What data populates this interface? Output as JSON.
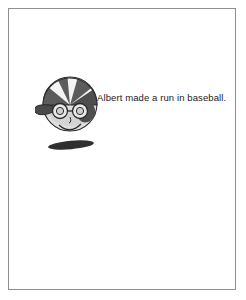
{
  "page": {
    "border_color": "#8e8e8e",
    "background_color": "#ffffff"
  },
  "panels": [
    {
      "id": "top",
      "speaker": "boy",
      "text": "Albert made a run in baseball."
    },
    {
      "id": "bottom",
      "speaker": "girl",
      "text": "Great!  But I thought run\nwas moving one's legs\nrapidly,  a nose discharging\nmatter,  or a lengthwise ravel."
    }
  ],
  "characters": {
    "boy": {
      "name": "boy-with-baseball-cap",
      "features": [
        "baseball-cap",
        "round-glasses",
        "smile",
        "baseball-bat"
      ],
      "cap_dark_color": "#5a5a5a",
      "cap_light_color": "#f2f2f2",
      "skin_color": "#d9d9d9",
      "outline_color": "#2b2b2b"
    },
    "girl": {
      "name": "girl-with-pigtails",
      "features": [
        "pigtails",
        "hair-bows",
        "smile",
        "dress"
      ],
      "hair_color": "#8a8a8a",
      "skin_color": "#d6d6d6",
      "dress_color": "#8a8a8a",
      "outline_color": "#2b2b2b"
    }
  }
}
